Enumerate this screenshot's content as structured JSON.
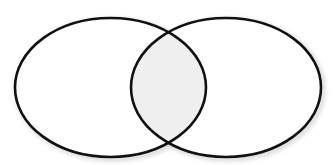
{
  "diagram": {
    "type": "venn",
    "sets": [
      {
        "id": "left",
        "cx": 110.5,
        "cy": 87.5,
        "rx": 95.5,
        "ry": 69.5
      },
      {
        "id": "right",
        "cx": 226,
        "cy": 87.5,
        "rx": 95,
        "ry": 69.5
      }
    ],
    "highlight": "intersection",
    "colors": {
      "background": "#ffffff",
      "stroke": "#111111",
      "intersection_fill": "#efefef",
      "shadow": "#d8d8d8"
    },
    "stroke_width": 2.6
  }
}
